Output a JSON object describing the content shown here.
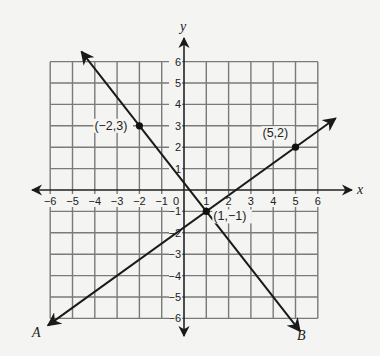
{
  "chart_data": {
    "type": "line",
    "title": "",
    "xlabel": "x",
    "ylabel": "y",
    "xlim": [
      -6,
      6
    ],
    "ylim": [
      -6,
      6
    ],
    "grid": true,
    "x_ticks": [
      "-6",
      "-5",
      "-4",
      "-3",
      "-2",
      "-1",
      "0",
      "1",
      "2",
      "3",
      "4",
      "5",
      "6"
    ],
    "y_ticks": [
      "6",
      "5",
      "4",
      "3",
      "2",
      "1",
      "-1",
      "-2",
      "-3",
      "-4",
      "-5",
      "-6"
    ],
    "series": [
      {
        "name": "A",
        "description": "Line through (1,-1) and (5,2)",
        "points": [
          [
            1,
            -1
          ],
          [
            5,
            2
          ]
        ],
        "slope": 0.75,
        "y_intercept": -1.75
      },
      {
        "name": "B",
        "description": "Line through (-2,3) and (1,-1)",
        "points": [
          [
            -2,
            3
          ],
          [
            1,
            -1
          ]
        ],
        "slope": -1.3333,
        "y_intercept": 0.3333
      }
    ],
    "annotations": [
      {
        "label": "(-2,3)",
        "x": -2,
        "y": 3
      },
      {
        "label": "(5,2)",
        "x": 5,
        "y": 2
      },
      {
        "label": "(1,-1)",
        "x": 1,
        "y": -1
      }
    ]
  },
  "labels": {
    "x_axis": "x",
    "y_axis": "y",
    "line_a": "A",
    "line_b": "B",
    "pt1": "(−2,3)",
    "pt2": "(5,2)",
    "pt3": "(1,−1)",
    "origin": "0"
  }
}
